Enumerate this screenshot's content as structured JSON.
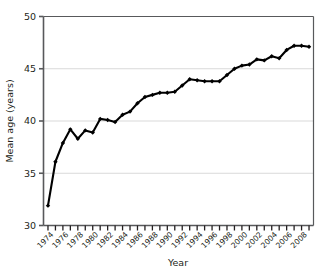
{
  "chart_data": {
    "type": "line",
    "title": "",
    "xlabel": "Year",
    "ylabel": "Mean age (years)",
    "xlim": [
      1972.4,
      2008.6
    ],
    "ylim": [
      30,
      50
    ],
    "grid": "horizontal",
    "legend": "none",
    "line_color": "#000000",
    "marker": "diamond",
    "y_ticks": [
      30,
      35,
      40,
      45,
      50
    ],
    "y_tick_labels": [
      "30",
      "35",
      "40",
      "45",
      "50"
    ],
    "x_tick_labels": [
      "1974",
      "1976",
      "1978",
      "1980",
      "1982",
      "1984",
      "1986",
      "1988",
      "1990",
      "1992",
      "1994",
      "1996",
      "1998",
      "2000",
      "2002",
      "2004",
      "2006",
      "2008"
    ],
    "x_minor_ticks": [
      1973,
      1975,
      1977,
      1979,
      1981,
      1983,
      1985,
      1987,
      1989,
      1991,
      1993,
      1995,
      1997,
      1999,
      2001,
      2003,
      2005,
      2007
    ],
    "x": [
      1973,
      1974,
      1975,
      1976,
      1977,
      1978,
      1979,
      1980,
      1981,
      1982,
      1983,
      1984,
      1985,
      1986,
      1987,
      1988,
      1989,
      1990,
      1991,
      1992,
      1993,
      1994,
      1995,
      1996,
      1997,
      1998,
      1999,
      2000,
      2001,
      2002,
      2003,
      2004,
      2005,
      2006,
      2007,
      2008
    ],
    "values": [
      31.9,
      36.1,
      37.9,
      39.2,
      38.3,
      39.1,
      38.9,
      40.2,
      40.1,
      39.9,
      40.6,
      40.9,
      41.7,
      42.3,
      42.5,
      42.7,
      42.7,
      42.8,
      43.4,
      44.0,
      43.9,
      43.8,
      43.8,
      43.8,
      44.4,
      45.0,
      45.3,
      45.4,
      45.9,
      45.8,
      46.2,
      46.0,
      46.8,
      47.2,
      47.2,
      47.1
    ],
    "series_name": "Mean age"
  },
  "figure": {
    "background": "#ffffff",
    "axis_color": "#58595b",
    "gridline_color": "#d9d9d9"
  }
}
